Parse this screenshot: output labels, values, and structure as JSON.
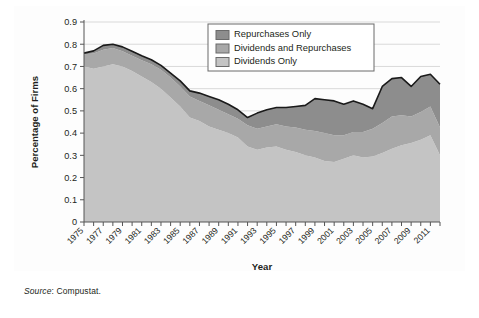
{
  "figure": {
    "source_label": "Source",
    "source_text": ": Compustat."
  },
  "chart_data": {
    "type": "area",
    "stacked": true,
    "title": "",
    "xlabel": "Year",
    "ylabel": "Percentage of Firms",
    "xlim": [
      1975,
      2012
    ],
    "ylim": [
      0,
      0.9
    ],
    "grid": true,
    "grid_axis": "y",
    "legend_position": "top-center-right",
    "ytick_labels": [
      "0",
      "0.1",
      "0.2",
      "0.3",
      "0.4",
      "0.5",
      "0.6",
      "0.7",
      "0.8",
      "0.9"
    ],
    "ytick_values": [
      0,
      0.1,
      0.2,
      0.3,
      0.4,
      0.5,
      0.6,
      0.7,
      0.8,
      0.9
    ],
    "xtick_labels": [
      "1975",
      "1977",
      "1979",
      "1981",
      "1983",
      "1985",
      "1987",
      "1989",
      "1991",
      "1993",
      "1995",
      "1997",
      "1999",
      "2001",
      "2003",
      "2005",
      "2007",
      "2009",
      "2011"
    ],
    "xtick_values": [
      1975,
      1977,
      1979,
      1981,
      1983,
      1985,
      1987,
      1989,
      1991,
      1993,
      1995,
      1997,
      1999,
      2001,
      2003,
      2005,
      2007,
      2009,
      2011
    ],
    "x": [
      1975,
      1976,
      1977,
      1978,
      1979,
      1980,
      1981,
      1982,
      1983,
      1984,
      1985,
      1986,
      1987,
      1988,
      1989,
      1990,
      1991,
      1992,
      1993,
      1994,
      1995,
      1996,
      1997,
      1998,
      1999,
      2000,
      2001,
      2002,
      2003,
      2004,
      2005,
      2006,
      2007,
      2008,
      2009,
      2010,
      2011,
      2012
    ],
    "colors": {
      "repurchases_only": "#8d8d8d",
      "dividends_and_repurchases": "#a8a8a8",
      "dividends_only": "#c4c4c4",
      "outline": "#1a1a1a",
      "gridline": "#d9d9d9",
      "axis": "#555555"
    },
    "series": [
      {
        "name": "Dividends Only",
        "color": "#c4c4c4",
        "stack_order": 1,
        "values": [
          0.7,
          0.69,
          0.7,
          0.71,
          0.7,
          0.68,
          0.655,
          0.63,
          0.6,
          0.56,
          0.52,
          0.47,
          0.455,
          0.43,
          0.415,
          0.4,
          0.38,
          0.34,
          0.325,
          0.335,
          0.34,
          0.325,
          0.315,
          0.3,
          0.29,
          0.275,
          0.27,
          0.285,
          0.3,
          0.29,
          0.295,
          0.31,
          0.33,
          0.345,
          0.355,
          0.37,
          0.39,
          0.3
        ]
      },
      {
        "name": "Dividends and Repurchases",
        "color": "#a8a8a8",
        "stack_order": 2,
        "values": [
          0.055,
          0.068,
          0.075,
          0.073,
          0.068,
          0.068,
          0.073,
          0.08,
          0.085,
          0.09,
          0.09,
          0.095,
          0.09,
          0.095,
          0.09,
          0.085,
          0.085,
          0.095,
          0.095,
          0.095,
          0.1,
          0.105,
          0.11,
          0.115,
          0.12,
          0.125,
          0.12,
          0.105,
          0.105,
          0.115,
          0.125,
          0.135,
          0.145,
          0.135,
          0.12,
          0.125,
          0.13,
          0.125
        ]
      },
      {
        "name": "Repurchases Only",
        "color": "#8d8d8d",
        "stack_order": 3,
        "values": [
          0.005,
          0.012,
          0.02,
          0.017,
          0.02,
          0.02,
          0.02,
          0.02,
          0.02,
          0.02,
          0.025,
          0.025,
          0.035,
          0.04,
          0.045,
          0.045,
          0.04,
          0.035,
          0.07,
          0.075,
          0.075,
          0.085,
          0.095,
          0.11,
          0.145,
          0.15,
          0.155,
          0.14,
          0.14,
          0.125,
          0.09,
          0.165,
          0.17,
          0.17,
          0.135,
          0.16,
          0.145,
          0.195
        ]
      }
    ],
    "totals": [
      0.76,
      0.77,
      0.795,
      0.8,
      0.788,
      0.768,
      0.748,
      0.73,
      0.705,
      0.67,
      0.635,
      0.59,
      0.58,
      0.565,
      0.55,
      0.53,
      0.505,
      0.47,
      0.49,
      0.505,
      0.515,
      0.515,
      0.52,
      0.525,
      0.555,
      0.55,
      0.545,
      0.53,
      0.545,
      0.53,
      0.51,
      0.61,
      0.645,
      0.65,
      0.61,
      0.655,
      0.665,
      0.62
    ]
  }
}
